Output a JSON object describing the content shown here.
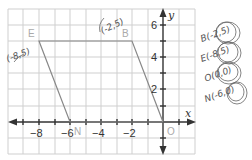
{
  "graph": {
    "x_axis_label": "x",
    "y_axis_label": "y",
    "x_ticks": [
      {
        "value": -8,
        "label": "−8"
      },
      {
        "value": -6,
        "label": "−6"
      },
      {
        "value": -4,
        "label": "−4"
      },
      {
        "value": -2,
        "label": "−2"
      }
    ],
    "y_ticks": [
      {
        "value": 6,
        "label": "6"
      },
      {
        "value": 4,
        "label": "4"
      },
      {
        "value": 2,
        "label": "2"
      }
    ],
    "vertices": [
      {
        "name": "E",
        "x": -8,
        "y": 5
      },
      {
        "name": "B",
        "x": -2,
        "y": 5
      },
      {
        "name": "O",
        "x": 0,
        "y": 0
      },
      {
        "name": "N",
        "x": -6,
        "y": 0
      }
    ],
    "colors": {
      "grid": "#cfcfcf",
      "axis": "#333333",
      "shape": "#888888",
      "handwriting": "#555555"
    }
  },
  "handwriting": {
    "e_coord": "(-8,5)",
    "b_coord": "(-2,5)",
    "list": [
      {
        "text": "B(-2,5)"
      },
      {
        "text": "E(-8,5)"
      },
      {
        "text": "O(0,0)"
      },
      {
        "text": "N(-6,0)"
      }
    ]
  }
}
